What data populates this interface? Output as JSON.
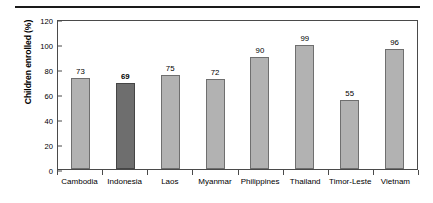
{
  "chart_data": {
    "type": "bar",
    "title": "",
    "xlabel": "",
    "ylabel": "Children enrolled (%)",
    "ylim": [
      0,
      120
    ],
    "yticks": [
      0,
      20,
      40,
      60,
      80,
      100,
      120
    ],
    "grid": false,
    "legend": null,
    "categories": [
      "Cambodia",
      "Indonesia",
      "Laos",
      "Myanmar",
      "Philippines",
      "Thailand",
      "Timor-Leste",
      "Vietnam"
    ],
    "values": [
      73,
      69,
      75,
      72,
      90,
      99,
      55,
      96
    ],
    "value_labels": [
      "73",
      "69",
      "75",
      "72",
      "90",
      "99",
      "55",
      "96"
    ],
    "highlight_index": 1,
    "colors": {
      "bar_fill": "#b2b2b2",
      "bar_border": "#6f6f6f",
      "highlight_fill": "#6e6e6e",
      "highlight_border": "#454545",
      "axis": "#4a4a4a",
      "text": "#000000",
      "rule": "#1a1a1a",
      "background": "#ffffff"
    }
  }
}
